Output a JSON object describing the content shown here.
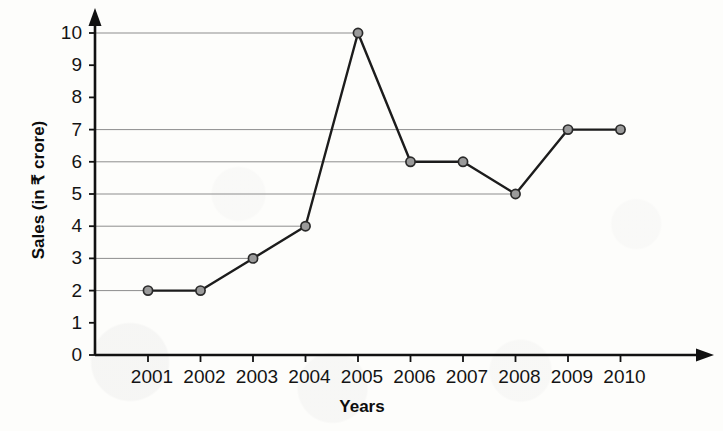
{
  "chart_data": {
    "type": "line",
    "title": "",
    "xlabel": "Years",
    "ylabel": "Sales (in ₹ crore)",
    "categories": [
      "2001",
      "2002",
      "2003",
      "2004",
      "2005",
      "2006",
      "2007",
      "2008",
      "2009",
      "2010"
    ],
    "values": [
      2,
      2,
      3,
      4,
      10,
      6,
      6,
      5,
      7,
      7
    ],
    "series": [
      {
        "name": "Sales",
        "values": [
          2,
          2,
          3,
          4,
          10,
          6,
          6,
          5,
          7,
          7
        ]
      }
    ],
    "ylim": [
      0,
      10
    ],
    "y_ticks": [
      0,
      1,
      2,
      3,
      4,
      5,
      6,
      7,
      8,
      9,
      10
    ],
    "y_tick_labels": [
      "0",
      "1",
      "2",
      "3",
      "4",
      "5",
      "6",
      "7",
      "8",
      "9",
      "10"
    ],
    "grid": "horizontal-partial",
    "gridline_values": [
      2,
      3,
      4,
      5,
      6,
      7,
      10
    ],
    "legend": "none",
    "marker": "circle",
    "marker_fill": "#9a9a9a",
    "marker_stroke": "#2a2a2a",
    "line_color": "#1c1c1c",
    "gridline_color": "#8d8d8d",
    "axis_color": "#111111",
    "background_color": "#fdfdfb"
  },
  "axes": {
    "y_axis_title": "Sales (in ₹ crore)",
    "x_axis_title": "Years",
    "y_arrow": "up-arrow-icon",
    "x_arrow": "right-arrow-icon"
  }
}
